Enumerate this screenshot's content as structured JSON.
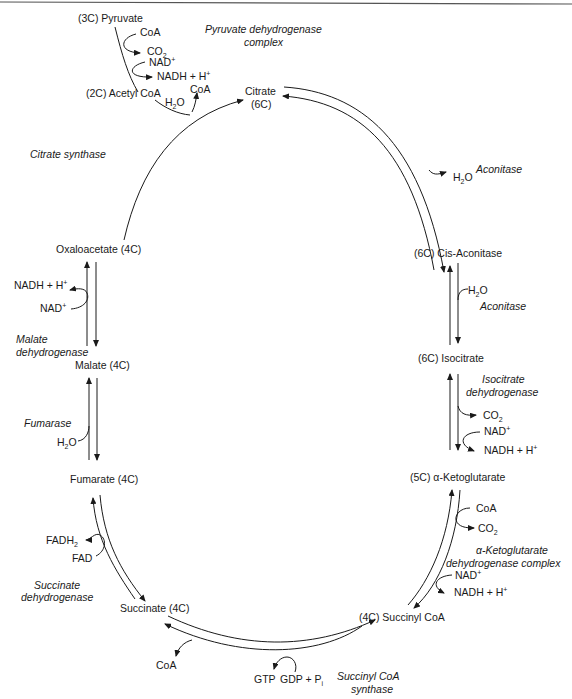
{
  "colors": {
    "ink": "#1a1a1a",
    "background": "#ffffff"
  },
  "header_fragment": "(contd.)",
  "entry": {
    "pyruvate": "(3C) Pyruvate",
    "coa_in": "CoA",
    "co2_out": "CO",
    "co2_sub": "2",
    "nad_in": "NAD",
    "nad_sup": "+",
    "nadh_out": "NADH + H",
    "nadh_sup": "+",
    "enzyme_line1": "Pyruvate dehydrogenase",
    "enzyme_line2": "complex",
    "acetyl_coa": "(2C) Acetyl CoA"
  },
  "citrate_synthase_step": {
    "h2o_h": "H",
    "h2o_sub": "2",
    "h2o_o": "O",
    "coa_out": "CoA",
    "enzyme": "Citrate synthase"
  },
  "metabolites": {
    "citrate_line1": "Citrate",
    "citrate_line2": "(6C)",
    "cis_aconitase": "(6C) Cis-Aconitase",
    "isocitrate": "(6C) Isocitrate",
    "alpha_ketoglutarate": "(5C) α-Ketoglutarate",
    "succinyl_coa": "(4C) Succinyl CoA",
    "succinate": "Succinate (4C)",
    "fumarate": "Fumarate (4C)",
    "malate": "Malate (4C)",
    "oxaloacetate": "Oxaloacetate (4C)"
  },
  "aconitase_1": {
    "h2o_h": "H",
    "h2o_sub": "2",
    "h2o_o": "O",
    "enzyme": "Aconitase"
  },
  "aconitase_2": {
    "h2o_h": "H",
    "h2o_sub": "2",
    "h2o_o": "O",
    "enzyme": "Aconitase"
  },
  "isocitrate_dh": {
    "enzyme_line1": "Isocitrate",
    "enzyme_line2": "dehydrogenase",
    "co2": "CO",
    "co2_sub": "2",
    "nad": "NAD",
    "nad_sup": "+",
    "nadh": "NADH + H",
    "nadh_sup": "+"
  },
  "akg_dh": {
    "coa": "CoA",
    "co2": "CO",
    "co2_sub": "2",
    "enzyme_line1": "α-Ketoglutarate",
    "enzyme_line2": "dehydrogenase complex",
    "nad": "NAD",
    "nad_sup": "+",
    "nadh": "NADH + H",
    "nadh_sup": "+"
  },
  "succinyl_coa_synthase": {
    "coa": "CoA",
    "gtp": "GTP",
    "gdp": "GDP + P",
    "gdp_sub": "i",
    "enzyme_line1": "Succinyl CoA",
    "enzyme_line2": "synthase"
  },
  "succinate_dh": {
    "fadh2": "FADH",
    "fadh2_sub": "2",
    "fad": "FAD",
    "enzyme_line1": "Succinate",
    "enzyme_line2": "dehydrogenase"
  },
  "fumarase": {
    "h2o_h": "H",
    "h2o_sub": "2",
    "h2o_o": "O",
    "enzyme": "Fumarase"
  },
  "malate_dh": {
    "nadh": "NADH + H",
    "nadh_sup": "+",
    "nad": "NAD",
    "nad_sup": "+",
    "enzyme_line1": "Malate",
    "enzyme_line2": "dehydrogenase"
  }
}
